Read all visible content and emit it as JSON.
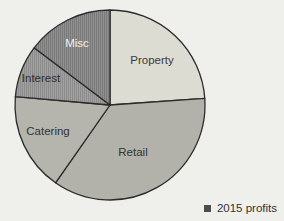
{
  "canvas": {
    "width": 284,
    "height": 221,
    "background": "#EFEFEC"
  },
  "chart_data": {
    "type": "pie",
    "geometry": {
      "cx": 110,
      "cy": 105,
      "r": 95
    },
    "start_angle": "12 o'clock, clockwise",
    "slices": [
      {
        "label": "Property",
        "start_deg": 0,
        "end_deg": 86,
        "percent": 23.9,
        "pattern": "solid",
        "fill": "#DCDCD3",
        "stripe_fill": null,
        "label_color": "#3A3A3A",
        "label_pos": [
          152,
          60
        ]
      },
      {
        "label": "Retail",
        "start_deg": 86,
        "end_deg": 215,
        "percent": 35.8,
        "pattern": "solid",
        "fill": "#B2B2AA",
        "stripe_fill": null,
        "label_color": "#333333",
        "label_pos": [
          133,
          152
        ]
      },
      {
        "label": "Catering",
        "start_deg": 215,
        "end_deg": 275,
        "percent": 16.7,
        "pattern": "solid",
        "fill": "#B5B5AE",
        "stripe_fill": null,
        "label_color": "#333333",
        "label_pos": [
          48,
          131
        ]
      },
      {
        "label": "Interest",
        "start_deg": 275,
        "end_deg": 307,
        "percent": 8.9,
        "pattern": "vertical-stripes",
        "fill": "#A1A1A1",
        "stripe_fill": "#8C8C8C",
        "label_color": "#2E2E2E",
        "label_pos": [
          41,
          78
        ]
      },
      {
        "label": "Misc",
        "start_deg": 307,
        "end_deg": 360,
        "percent": 14.7,
        "pattern": "vertical-stripes",
        "fill": "#909090",
        "stripe_fill": "#7A7A7A",
        "label_color": "#F0F0ED",
        "label_pos": [
          77,
          43
        ]
      }
    ],
    "legend": [
      {
        "label": "2015 profits",
        "color": "#4D4D4D"
      }
    ],
    "legend_position": "bottom-right",
    "outline_color": "#2B2B2B"
  }
}
